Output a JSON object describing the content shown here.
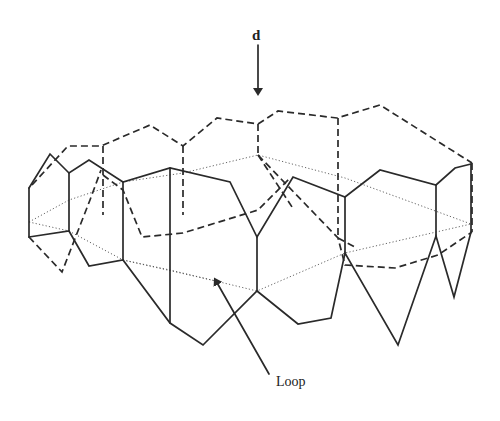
{
  "labels": {
    "direction": "d",
    "loop": "Loop"
  },
  "colors": {
    "background": "#ffffff",
    "ink": "#2a2a2a"
  },
  "geometry": {
    "direction_arrow": {
      "x": 258,
      "y1": 45,
      "y2": 92
    },
    "loop_arrow": {
      "from": [
        269,
        374
      ],
      "to": [
        216,
        281
      ]
    },
    "dashed_back": [
      "32,185 68,146 101,146 150,125 183,146 217,118 258,124 278,111 337,118 380,105 472,163",
      "103,146 103,215",
      "183,146 183,215",
      "258,124 258,155",
      "338,118 338,238",
      "472,163 472,232",
      "29,237 62,272 90,200 101,170",
      "103,175 123,190 142,237 183,233 258,210 290,178",
      "258,155 338,238 345,265 395,268 438,255 472,232",
      "258,155 294,210",
      "338,238 355,247"
    ],
    "solid_front": [
      "29,188 50,154 69,173 89,160 123,182 170,168 230,182 257,237 293,177 345,197 380,170 436,185 455,168 471,164",
      "29,188 29,237",
      "69,173 69,231",
      "123,182 123,260",
      "170,168 170,323",
      "257,237 257,291",
      "345,197 345,253",
      "436,185 436,236",
      "471,164 471,232",
      "29,237 69,231 89,266 123,260 170,323 203,345 257,291 298,324 331,318 345,253 398,345 436,236 454,297 471,232"
    ],
    "dotted_internal": [
      "29,222 69,200 123,182 183,173 258,155 345,178 471,224",
      "29,222 69,231",
      "69,231 123,260 170,270 257,291 345,253 471,224",
      "123,260 216,281"
    ]
  }
}
